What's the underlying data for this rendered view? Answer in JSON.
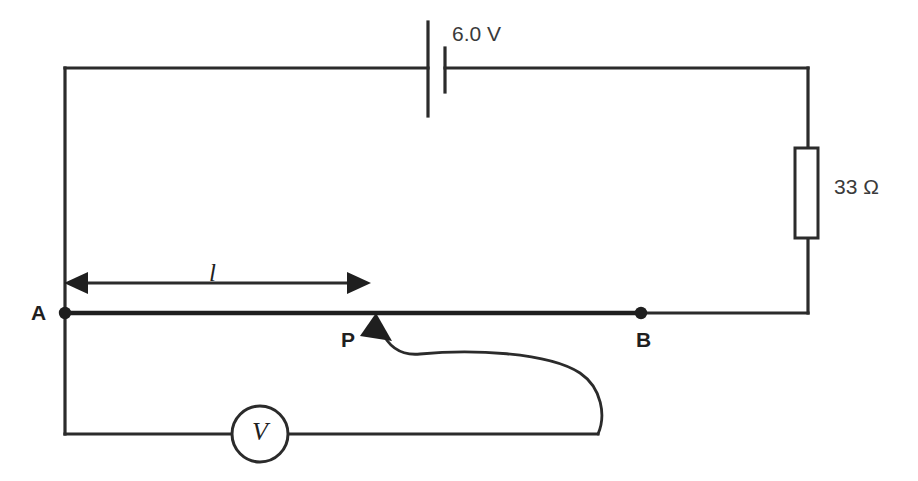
{
  "diagram": {
    "type": "circuit-schematic",
    "background_color": "#ffffff",
    "wire_color": "#2b2b2b",
    "labels": {
      "supply_voltage": "6.0 V",
      "resistor_value": "33 Ω",
      "length_symbol": "l",
      "node_a": "A",
      "node_b": "B",
      "node_p": "P",
      "voltmeter_symbol": "V"
    },
    "components": [
      {
        "name": "battery",
        "label": "6.0 V",
        "kind": "cell",
        "orientation": "horizontal",
        "position": "top-branch"
      },
      {
        "name": "resistor",
        "label": "33 Ω",
        "kind": "resistor",
        "orientation": "vertical",
        "position": "right-branch"
      },
      {
        "name": "voltmeter",
        "label": "V",
        "kind": "voltmeter",
        "orientation": "horizontal",
        "position": "bottom-branch"
      },
      {
        "name": "resistance-wire-ab",
        "kind": "uniform-resistance-wire",
        "endpoints": [
          "A",
          "B"
        ],
        "orientation": "horizontal"
      },
      {
        "name": "sliding-contact",
        "kind": "jockey",
        "label": "P",
        "position": "on-wire-ab"
      }
    ],
    "annotations": [
      {
        "name": "length-dimension",
        "symbol": "l",
        "from": "A",
        "to": "P",
        "style": "double-headed-arrow"
      }
    ]
  }
}
